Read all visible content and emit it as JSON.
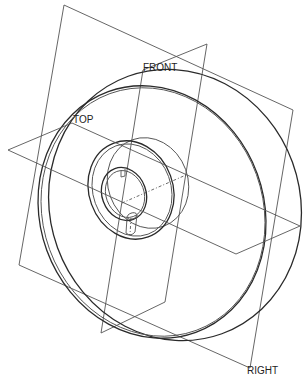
{
  "drawing": {
    "description": "Isometric CAD view of a pulley/disc with hub, keyway and set-screw hole, with datum planes",
    "datum_planes": [
      {
        "name": "front",
        "label": "FRONT"
      },
      {
        "name": "top",
        "label": "TOP"
      },
      {
        "name": "right",
        "label": "RIGHT"
      }
    ],
    "colors": {
      "line": "#2a2a2a",
      "plane": "#555555",
      "background": "#ffffff"
    }
  }
}
